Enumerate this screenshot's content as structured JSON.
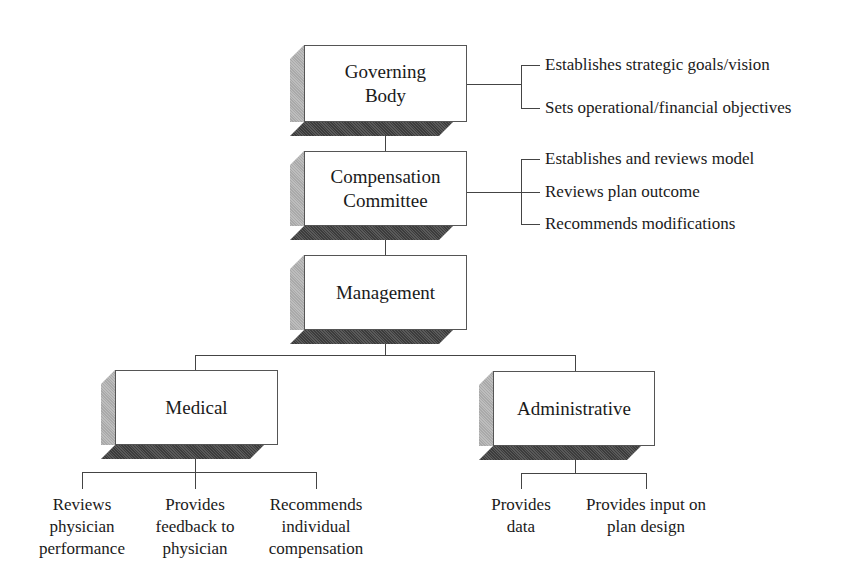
{
  "diagram": {
    "type": "organizational-hierarchy",
    "nodes": {
      "governing_body": {
        "label": "Governing\nBody",
        "responsibilities": [
          "Establishes strategic goals/vision",
          "Sets operational/financial objectives"
        ]
      },
      "compensation_committee": {
        "label": "Compensation\nCommittee",
        "responsibilities": [
          "Establishes and reviews model",
          "Reviews plan outcome",
          "Recommends modifications"
        ]
      },
      "management": {
        "label": "Management"
      },
      "medical": {
        "label": "Medical",
        "responsibilities": [
          "Reviews\nphysician\nperformance",
          "Provides\nfeedback to\nphysician",
          "Recommends\nindividual\ncompensation"
        ]
      },
      "administrative": {
        "label": "Administrative",
        "responsibilities": [
          "Provides\ndata",
          "Provides input on\nplan design"
        ]
      }
    },
    "edges": [
      [
        "governing_body",
        "compensation_committee"
      ],
      [
        "compensation_committee",
        "management"
      ],
      [
        "management",
        "medical"
      ],
      [
        "management",
        "administrative"
      ]
    ],
    "colors": {
      "face": "#ffffff",
      "side_shade": "#b4b4b4",
      "bottom_shade": "#4a4a4a",
      "line": "#444444",
      "text": "#1a1a1a"
    }
  }
}
